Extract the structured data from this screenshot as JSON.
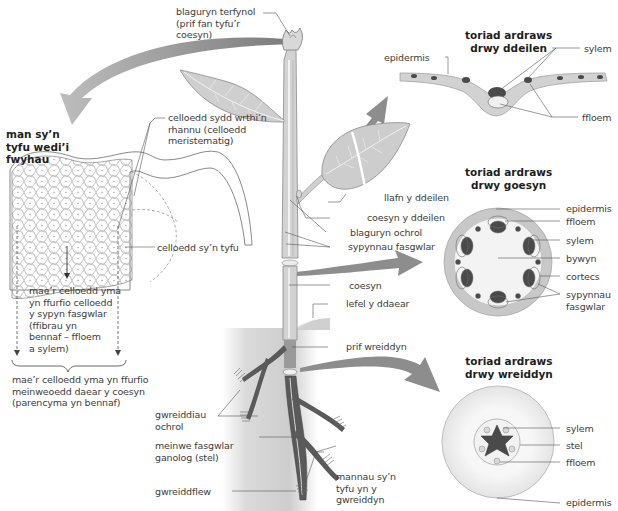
{
  "diagram": {
    "titles": {
      "growth_region": "man sy’n\ntyfu wedi’i\nfwyhau",
      "leaf_section": "toriad ardraws\ndrwy ddeilen",
      "stem_section": "toriad ardraws\ndrwy goesyn",
      "root_section": "toriad ardraws\ndrwy wreiddyn"
    },
    "plant_labels": {
      "terminal_bud": "blaguryn terfynol\n(prif fan tyfu’r\ncoesyn)",
      "leaf_blade": "llafn y ddeilen",
      "leaf_stalk": "coesyn y ddeilen",
      "lateral_bud": "blaguryn ochrol",
      "vascular_bundles": "sypynnau fasgwlar",
      "stem": "coesyn",
      "ground_level": "lefel y ddaear",
      "main_root": "prif wreiddyn",
      "lateral_roots": "gwreiddiau\nochrol",
      "central_vascular_tissue": "meinwe fasgwlar\nganolog (stel)",
      "root_hair": "gwreiddflew",
      "root_growing_points": "mannau sy’n\ntyfu yn y\ngwreiddyn"
    },
    "growth_labels": {
      "dividing_cells": "celloedd sydd wrthi’n\nrhannu (celloedd\nmeristematig)",
      "growing_cells": "celloedd sy’n tyfu",
      "vascular_cells_note": "mae’r celloedd yma\nyn ffurfio celloedd\ny sypyn fasgwlar\n(ffibrau yn\nbennaf – ffloem\na sylem)",
      "ground_tissue_note": "mae’r celloedd yma yn ffurfio\nmeinweoedd daear y coesyn\n(parencyma yn bennaf)"
    },
    "leaf_section_labels": {
      "epidermis": "epidermis",
      "xylem": "sylem",
      "phloem": "ffloem"
    },
    "stem_section_labels": {
      "epidermis": "epidermis",
      "phloem": "ffloem",
      "xylem": "sylem",
      "pith": "bywyn",
      "cortex": "cortecs",
      "vascular_bundles": "sypynnau\nfasgwlar"
    },
    "root_section_labels": {
      "xylem": "sylem",
      "stele": "stel",
      "phloem": "ffloem",
      "epidermis": "epidermis"
    },
    "colors": {
      "arrow": "#8a8a8a",
      "plant_fill": "#c9c9c9",
      "dark_tissue": "#4a4a4a",
      "soil": "#bdbdbd",
      "line": "#555555"
    }
  }
}
